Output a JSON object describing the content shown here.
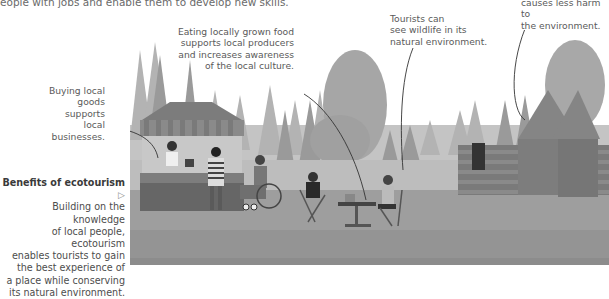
{
  "intro_fragment": "eople with jobs and enable them to develop new skills.",
  "annotations": {
    "buying_local": [
      "Buying local",
      "goods supports",
      "local businesses."
    ],
    "eating_local": [
      "Eating locally grown food",
      "supports local producers",
      "and increases awareness",
      "of the local culture."
    ],
    "wildlife": [
      "Tourists can",
      "see wildlife in its",
      "natural environment."
    ],
    "environment": [
      "causes less harm to",
      "the environment."
    ]
  },
  "sidebar": {
    "title": "Benefits of ecotourism",
    "title_icon": "triangle-right-outline-icon",
    "body": [
      "Building on the knowledge",
      "of local people, ecotourism",
      "enables tourists to gain",
      "the best experience of",
      "a place while conserving",
      "its natural environment."
    ]
  },
  "illustration": {
    "subject": "ecotourism scene: forest, market stall, wheelchair user, tourists at table, log cabins",
    "colors": {
      "sky": "#ffffff",
      "forest_light": "#a9a9a9",
      "forest_dark": "#6e6e6e",
      "ground": "#9c9c9c",
      "cabin": "#7a7a7a"
    }
  }
}
